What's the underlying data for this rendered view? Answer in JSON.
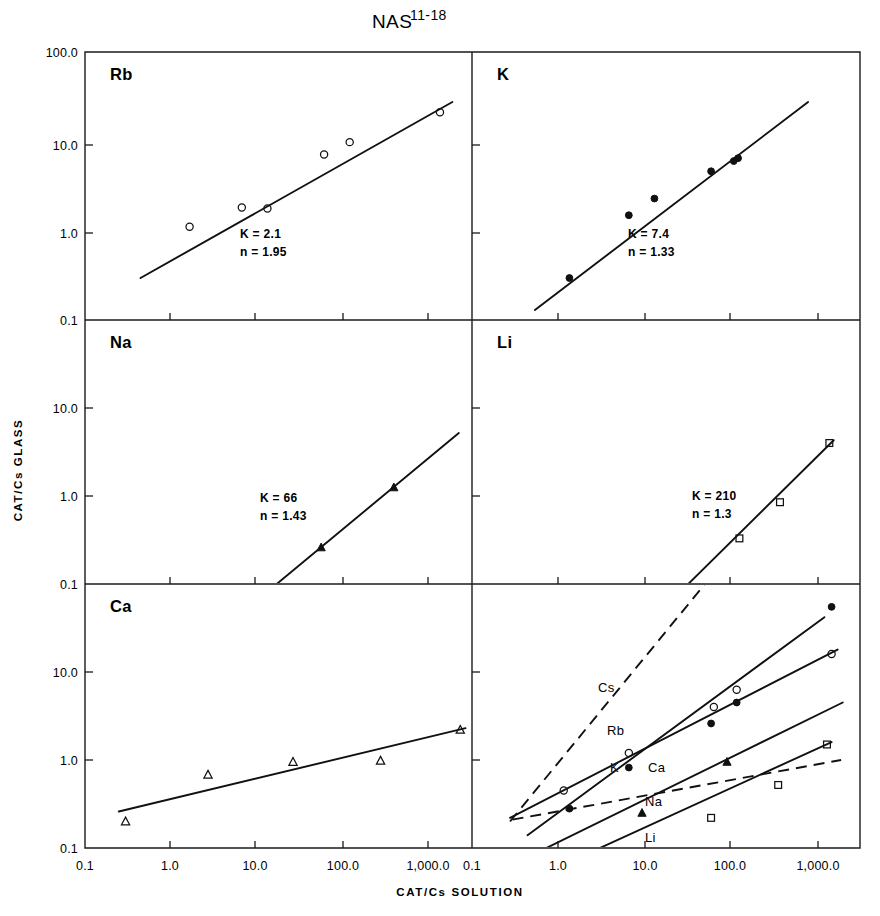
{
  "figure": {
    "title_main": "NAS",
    "title_sup": "11-18",
    "y_axis_title": "CAT/Cs  GLASS",
    "x_axis_title": "CAT/Cs  SOLUTION"
  },
  "axes": {
    "x_ticks": [
      "0.1",
      "1.0",
      "10.0",
      "100.0",
      "1,000.0"
    ],
    "y_ticks": [
      "100.0",
      "10.0",
      "1.0",
      "0.1"
    ],
    "x_range": [
      0.1,
      10000.0
    ],
    "y_range": [
      0.1,
      100.0
    ],
    "scale": "log-log",
    "grid": false
  },
  "chart_data": {
    "type": "scatter",
    "title": "NAS 11-18",
    "xlabel": "CAT/Cs SOLUTION",
    "ylabel": "CAT/Cs GLASS",
    "xscale": "log",
    "yscale": "log",
    "xlim": [
      0.1,
      10000.0
    ],
    "ylim": [
      0.1,
      100.0
    ],
    "xticks": [
      0.1,
      1.0,
      10.0,
      100.0,
      1000.0
    ],
    "yticks": [
      0.1,
      1.0,
      10.0,
      100.0
    ],
    "grid": false,
    "legend": "none",
    "panels": [
      {
        "id": "rb",
        "label": "Rb",
        "marker": "open-circle",
        "K": "K = 2.1",
        "n": "n = 1.95",
        "K_value": 2.1,
        "n_value": 1.95,
        "points": [
          {
            "x": 1.7,
            "y": 1.15
          },
          {
            "x": 7.0,
            "y": 1.9
          },
          {
            "x": 14.0,
            "y": 1.85
          },
          {
            "x": 65.0,
            "y": 7.6
          },
          {
            "x": 130.0,
            "y": 10.5
          },
          {
            "x": 1500.0,
            "y": 23.0
          }
        ],
        "line": {
          "x0": 0.45,
          "y0": 0.3,
          "x1": 2100.0,
          "y1": 30.0
        }
      },
      {
        "id": "k",
        "label": "K",
        "marker": "filled-circle",
        "K": "K = 7.4",
        "n": "n = 1.33",
        "K_value": 7.4,
        "n_value": 1.33,
        "points": [
          {
            "x": 1.4,
            "y": 0.3
          },
          {
            "x": 7.0,
            "y": 1.55
          },
          {
            "x": 14.0,
            "y": 2.4
          },
          {
            "x": 65.0,
            "y": 4.9
          },
          {
            "x": 120.0,
            "y": 6.4
          },
          {
            "x": 135.0,
            "y": 6.9
          }
        ],
        "line": {
          "x0": 0.55,
          "y0": 0.13,
          "x1": 900.0,
          "y1": 30.0
        }
      },
      {
        "id": "na",
        "label": "Na",
        "marker": "filled-triangle",
        "K": "K = 66",
        "n": "n = 1.43",
        "K_value": 66,
        "n_value": 1.43,
        "points": [
          {
            "x": 60.0,
            "y": 0.26
          },
          {
            "x": 430.0,
            "y": 1.25
          }
        ],
        "line": {
          "x0": 18.0,
          "y0": 0.1,
          "x1": 2500.0,
          "y1": 5.2
        }
      },
      {
        "id": "li",
        "label": "Li",
        "marker": "open-square",
        "K": "K = 210",
        "n": "n = 1.3",
        "K_value": 210,
        "n_value": 1.3,
        "points": [
          {
            "x": 140.0,
            "y": 0.33
          },
          {
            "x": 420.0,
            "y": 0.85
          },
          {
            "x": 1600.0,
            "y": 4.0
          }
        ],
        "line": {
          "x0": 35.0,
          "y0": 0.1,
          "x1": 1800.0,
          "y1": 4.3
        }
      },
      {
        "id": "ca",
        "label": "Ca",
        "marker": "open-triangle",
        "K": "",
        "n": "",
        "points": [
          {
            "x": 0.3,
            "y": 0.2
          },
          {
            "x": 2.8,
            "y": 0.68
          },
          {
            "x": 28.0,
            "y": 0.95
          },
          {
            "x": 300.0,
            "y": 0.98
          },
          {
            "x": 2600.0,
            "y": 2.2
          }
        ],
        "line": {
          "x0": 0.25,
          "y0": 0.26,
          "x1": 3000.0,
          "y1": 2.3
        }
      },
      {
        "id": "combined",
        "label": "",
        "curves": [
          {
            "name": "Cs",
            "style": "dashed",
            "marker": "none",
            "line": {
              "x0": 0.28,
              "y0": 0.2,
              "x1": 55.0,
              "y1": 100.0
            }
          },
          {
            "name": "Rb",
            "style": "solid",
            "marker": "open-circle",
            "line": {
              "x0": 0.28,
              "y0": 0.22,
              "x1": 2000.0,
              "y1": 18.0
            },
            "points": [
              {
                "x": 1.2,
                "y": 0.45
              },
              {
                "x": 7.0,
                "y": 1.2
              },
              {
                "x": 70.0,
                "y": 4.0
              },
              {
                "x": 130.0,
                "y": 6.3
              },
              {
                "x": 1700.0,
                "y": 16.0
              }
            ]
          },
          {
            "name": "K",
            "style": "solid",
            "marker": "filled-circle",
            "line": {
              "x0": 0.45,
              "y0": 0.14,
              "x1": 1400.0,
              "y1": 42.0
            },
            "points": [
              {
                "x": 1.4,
                "y": 0.28
              },
              {
                "x": 7.0,
                "y": 0.82
              },
              {
                "x": 65.0,
                "y": 2.6
              },
              {
                "x": 130.0,
                "y": 4.5
              },
              {
                "x": 1700.0,
                "y": 55.0
              }
            ]
          },
          {
            "name": "Ca",
            "style": "dashed",
            "marker": "open-triangle",
            "line": {
              "x0": 0.3,
              "y0": 0.21,
              "x1": 2200.0,
              "y1": 1.0
            },
            "points": []
          },
          {
            "name": "Na",
            "style": "solid",
            "marker": "filled-triangle",
            "line": {
              "x0": 0.75,
              "y0": 0.1,
              "x1": 2300.0,
              "y1": 4.5
            },
            "points": [
              {
                "x": 10.0,
                "y": 0.25
              },
              {
                "x": 100.0,
                "y": 0.95
              }
            ]
          },
          {
            "name": "Li",
            "style": "solid",
            "marker": "open-square",
            "line": {
              "x0": 3.2,
              "y0": 0.1,
              "x1": 1700.0,
              "y1": 1.6
            },
            "points": [
              {
                "x": 65.0,
                "y": 0.22
              },
              {
                "x": 400.0,
                "y": 0.52
              },
              {
                "x": 1500.0,
                "y": 1.5
              }
            ]
          }
        ]
      }
    ]
  }
}
